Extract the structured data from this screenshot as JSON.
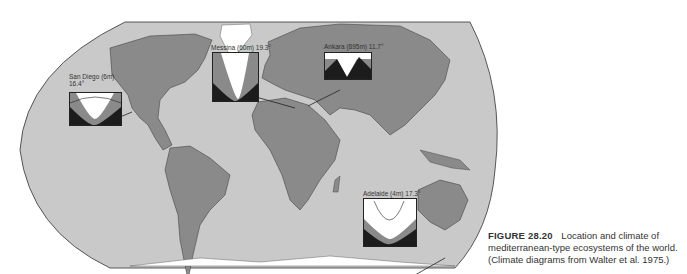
{
  "figure": {
    "number": "FIGURE 28.20",
    "caption_line1": "Location and climate of",
    "caption_line2": "mediterranean-type ecosystems of the world.",
    "caption_line3": "(Climate diagrams from Walter et al. 1975.)"
  },
  "climate_diagrams": [
    {
      "station": "San Diego (6m)",
      "temp": "16.4°"
    },
    {
      "station": "Messina (60m)",
      "temp": "19.3°"
    },
    {
      "station": "Ankara (895m)",
      "temp": "11.7°"
    },
    {
      "station": "Adelaide (4m)",
      "temp": "17.3°"
    }
  ],
  "colors": {
    "ocean": "#c8c8c8",
    "land": "#8a8a8a",
    "ice": "#ffffff",
    "outline": "#333333",
    "dark": "#1c1c1c"
  }
}
